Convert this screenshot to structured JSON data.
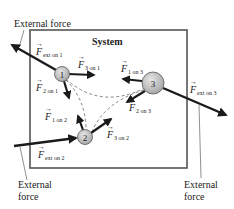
{
  "system": {
    "title": "System"
  },
  "particles": [
    {
      "id": "1",
      "label": "1"
    },
    {
      "id": "2",
      "label": "2"
    },
    {
      "id": "3",
      "label": "3"
    }
  ],
  "external_labels": {
    "top_left": "External force",
    "bottom_left_line1": "External",
    "bottom_left_line2": "force",
    "bottom_right_line1": "External",
    "bottom_right_line2": "force"
  },
  "forces": {
    "ext_on_1": {
      "symbol": "F",
      "sub": "ext on 1"
    },
    "ext_on_2": {
      "symbol": "F",
      "sub": "ext on 2"
    },
    "ext_on_3": {
      "symbol": "F",
      "sub": "ext on 3"
    },
    "f3_on_1": {
      "symbol": "F",
      "sub": "3 on 1"
    },
    "f2_on_1": {
      "symbol": "F",
      "sub": "2 on 1"
    },
    "f1_on_2": {
      "symbol": "F",
      "sub": "1 on 2"
    },
    "f3_on_2": {
      "symbol": "F",
      "sub": "3 on 2"
    },
    "f1_on_3": {
      "symbol": "F",
      "sub": "1 on 3"
    },
    "f2_on_3": {
      "symbol": "F",
      "sub": "2 on 3"
    }
  },
  "colors": {
    "particle_fill": "#c8c8c8",
    "particle_stroke": "#555555",
    "arrow": "#1a1a1a",
    "box": "#555555",
    "dashed": "#666666"
  }
}
